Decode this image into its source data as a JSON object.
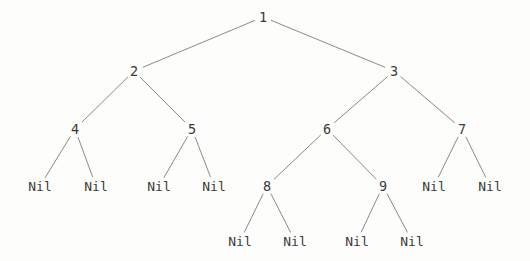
{
  "diagram": {
    "type": "binary-tree",
    "background_color": "#fdfdfc",
    "edge_color": "#8a8a8a",
    "text_color": "#3a3a3a",
    "nil_label": "Nil",
    "nodes": [
      {
        "id": "n1",
        "label": "1",
        "x": 263,
        "y": 17,
        "kind": "value"
      },
      {
        "id": "n2",
        "label": "2",
        "x": 134,
        "y": 71,
        "kind": "value"
      },
      {
        "id": "n3",
        "label": "3",
        "x": 394,
        "y": 71,
        "kind": "value"
      },
      {
        "id": "n4",
        "label": "4",
        "x": 75,
        "y": 129,
        "kind": "value"
      },
      {
        "id": "n5",
        "label": "5",
        "x": 192,
        "y": 129,
        "kind": "value"
      },
      {
        "id": "n6",
        "label": "6",
        "x": 327,
        "y": 129,
        "kind": "value"
      },
      {
        "id": "n7",
        "label": "7",
        "x": 462,
        "y": 129,
        "kind": "value"
      },
      {
        "id": "n8",
        "label": "8",
        "x": 267,
        "y": 186,
        "kind": "value"
      },
      {
        "id": "n9",
        "label": "9",
        "x": 383,
        "y": 186,
        "kind": "value"
      },
      {
        "id": "l1",
        "label": "Nil",
        "x": 40,
        "y": 186,
        "kind": "nil"
      },
      {
        "id": "l2",
        "label": "Nil",
        "x": 96,
        "y": 186,
        "kind": "nil"
      },
      {
        "id": "l3",
        "label": "Nil",
        "x": 159,
        "y": 186,
        "kind": "nil"
      },
      {
        "id": "l4",
        "label": "Nil",
        "x": 214,
        "y": 186,
        "kind": "nil"
      },
      {
        "id": "l5",
        "label": "Nil",
        "x": 434,
        "y": 186,
        "kind": "nil"
      },
      {
        "id": "l6",
        "label": "Nil",
        "x": 490,
        "y": 186,
        "kind": "nil"
      },
      {
        "id": "l7",
        "label": "Nil",
        "x": 240,
        "y": 241,
        "kind": "nil"
      },
      {
        "id": "l8",
        "label": "Nil",
        "x": 295,
        "y": 241,
        "kind": "nil"
      },
      {
        "id": "l9",
        "label": "Nil",
        "x": 357,
        "y": 241,
        "kind": "nil"
      },
      {
        "id": "l10",
        "label": "Nil",
        "x": 412,
        "y": 241,
        "kind": "nil"
      }
    ],
    "edges": [
      {
        "from": "n1",
        "to": "n2"
      },
      {
        "from": "n1",
        "to": "n3"
      },
      {
        "from": "n2",
        "to": "n4"
      },
      {
        "from": "n2",
        "to": "n5"
      },
      {
        "from": "n3",
        "to": "n6"
      },
      {
        "from": "n3",
        "to": "n7"
      },
      {
        "from": "n4",
        "to": "l1"
      },
      {
        "from": "n4",
        "to": "l2"
      },
      {
        "from": "n5",
        "to": "l3"
      },
      {
        "from": "n5",
        "to": "l4"
      },
      {
        "from": "n6",
        "to": "n8"
      },
      {
        "from": "n6",
        "to": "n9"
      },
      {
        "from": "n7",
        "to": "l5"
      },
      {
        "from": "n7",
        "to": "l6"
      },
      {
        "from": "n8",
        "to": "l7"
      },
      {
        "from": "n8",
        "to": "l8"
      },
      {
        "from": "n9",
        "to": "l9"
      },
      {
        "from": "n9",
        "to": "l10"
      }
    ]
  }
}
